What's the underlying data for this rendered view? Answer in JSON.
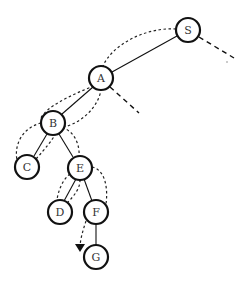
{
  "diagram": {
    "type": "tree-traversal",
    "nodes": [
      {
        "id": "S",
        "label": "S",
        "x": 188,
        "y": 30
      },
      {
        "id": "A",
        "label": "A",
        "x": 101,
        "y": 78
      },
      {
        "id": "B",
        "label": "B",
        "x": 53,
        "y": 123
      },
      {
        "id": "C",
        "label": "C",
        "x": 27,
        "y": 167
      },
      {
        "id": "E",
        "label": "E",
        "x": 80,
        "y": 168
      },
      {
        "id": "D",
        "label": "D",
        "x": 60,
        "y": 212
      },
      {
        "id": "F",
        "label": "F",
        "x": 96,
        "y": 212
      },
      {
        "id": "G",
        "label": "G",
        "x": 96,
        "y": 257
      }
    ],
    "edges": [
      [
        "S",
        "A"
      ],
      [
        "A",
        "B"
      ],
      [
        "B",
        "C"
      ],
      [
        "B",
        "E"
      ],
      [
        "E",
        "D"
      ],
      [
        "E",
        "F"
      ],
      [
        "F",
        "G"
      ]
    ],
    "unexplored_stubs": [
      "S",
      "A"
    ],
    "traversal_order": [
      "S",
      "A",
      "B",
      "C",
      "E",
      "D",
      "F",
      "G"
    ]
  }
}
